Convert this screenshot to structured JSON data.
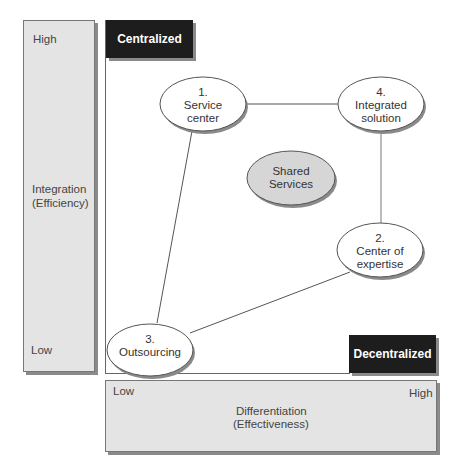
{
  "y_axis": {
    "high": "High",
    "low": "Low",
    "title_line1": "Integration",
    "title_line2": "(Efficiency)"
  },
  "x_axis": {
    "low": "Low",
    "high": "High",
    "title_line1": "Differentiation",
    "title_line2": "(Effectiveness)"
  },
  "corners": {
    "top_left": "Centralized",
    "bottom_right": "Decentralized"
  },
  "nodes": [
    {
      "id": "service-center",
      "line1": "1.",
      "line2": "Service",
      "line3": "center"
    },
    {
      "id": "center-of-expertise",
      "line1": "2.",
      "line2": "Center of",
      "line3": "expertise"
    },
    {
      "id": "outsourcing",
      "line1": "3.",
      "line2": "Outsourcing"
    },
    {
      "id": "integrated-solution",
      "line1": "4.",
      "line2": "Integrated",
      "line3": "solution"
    },
    {
      "id": "shared-services",
      "line1": "Shared",
      "line2": "Services"
    }
  ],
  "edges": [
    [
      "service-center",
      "integrated-solution"
    ],
    [
      "integrated-solution",
      "center-of-expertise"
    ],
    [
      "center-of-expertise",
      "outsourcing"
    ],
    [
      "outsourcing",
      "service-center"
    ]
  ],
  "colors": {
    "axis_bar": "#e4e4e4",
    "corner_box": "#1d1d1d",
    "shared_fill": "#d6d6d6"
  }
}
